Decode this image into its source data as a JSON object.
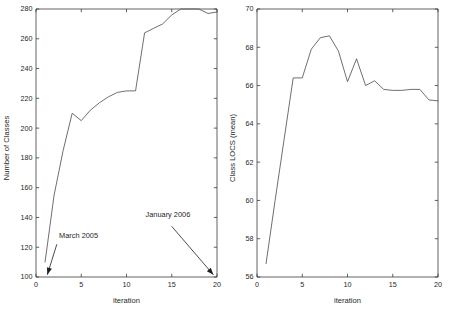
{
  "figure": {
    "background_color": "#ffffff",
    "line_color": "#4a4a4a",
    "axis_color": "#3a3a3a"
  },
  "chart_data": [
    {
      "type": "line",
      "panel": "left",
      "title": "",
      "xlabel": "iteration",
      "ylabel": "Number of Classes",
      "xlim": [
        0,
        20
      ],
      "ylim": [
        100,
        280
      ],
      "xticks": [
        0,
        5,
        10,
        15,
        20
      ],
      "yticks": [
        100,
        120,
        140,
        160,
        180,
        200,
        220,
        240,
        260,
        280
      ],
      "xtick_labels": [
        "0",
        "5",
        "10",
        "15",
        "20"
      ],
      "ytick_labels": [
        "100",
        "120",
        "140",
        "160",
        "180",
        "200",
        "220",
        "240",
        "260",
        "280"
      ],
      "grid": false,
      "legend": "none",
      "x": [
        1,
        2,
        3,
        4,
        5,
        6,
        7,
        8,
        9,
        10,
        11,
        12,
        13,
        14,
        15,
        16,
        17,
        18,
        19,
        20
      ],
      "values": [
        110,
        155,
        185,
        210,
        205,
        212,
        217,
        221,
        224,
        225,
        225,
        264,
        267,
        270,
        276,
        280,
        280,
        280,
        277,
        278
      ],
      "series": [
        {
          "name": "Number of Classes",
          "values": [
            110,
            155,
            185,
            210,
            205,
            212,
            217,
            221,
            224,
            225,
            225,
            264,
            267,
            270,
            276,
            280,
            280,
            280,
            277,
            278
          ]
        }
      ],
      "annotations": [
        {
          "text": "March 2005",
          "text_x": 2.55,
          "text_y": 126,
          "arrow_from_x": 2.3,
          "arrow_from_y": 122,
          "arrow_to_x": 1.25,
          "arrow_to_y": 101.5
        },
        {
          "text": "January 2006",
          "text_x": 12.1,
          "text_y": 140,
          "arrow_from_x": 15.0,
          "arrow_from_y": 134,
          "arrow_to_x": 19.6,
          "arrow_to_y": 101.5
        }
      ]
    },
    {
      "type": "line",
      "panel": "right",
      "title": "",
      "xlabel": "iteration",
      "ylabel": "Class LOCS (mean)",
      "xlim": [
        0,
        20
      ],
      "ylim": [
        56,
        70
      ],
      "xticks": [
        0,
        5,
        10,
        15,
        20
      ],
      "yticks": [
        56,
        58,
        60,
        62,
        64,
        66,
        68,
        70
      ],
      "xtick_labels": [
        "0",
        "5",
        "10",
        "15",
        "20"
      ],
      "ytick_labels": [
        "56",
        "58",
        "60",
        "62",
        "64",
        "66",
        "68",
        "70"
      ],
      "grid": false,
      "legend": "none",
      "x": [
        1,
        2,
        3,
        4,
        5,
        6,
        7,
        8,
        9,
        10,
        11,
        12,
        13,
        14,
        15,
        16,
        17,
        18,
        19,
        20
      ],
      "values": [
        56.7,
        60.0,
        63.2,
        66.4,
        66.4,
        67.9,
        68.5,
        68.6,
        67.8,
        66.2,
        67.4,
        66.0,
        66.25,
        65.8,
        65.75,
        65.75,
        65.8,
        65.8,
        65.25,
        65.2
      ],
      "series": [
        {
          "name": "Class LOCS (mean)",
          "values": [
            56.7,
            60.0,
            63.2,
            66.4,
            66.4,
            67.9,
            68.5,
            68.6,
            67.8,
            66.2,
            67.4,
            66.0,
            66.25,
            65.8,
            65.75,
            65.75,
            65.8,
            65.8,
            65.25,
            65.2
          ]
        }
      ],
      "annotations": []
    }
  ]
}
